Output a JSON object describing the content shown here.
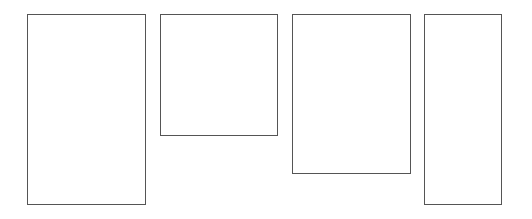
{
  "diagram": {
    "shape_count": 4,
    "shapes": [
      {
        "type": "rectangle",
        "label": ""
      },
      {
        "type": "rectangle",
        "label": ""
      },
      {
        "type": "rectangle",
        "label": ""
      },
      {
        "type": "rectangle",
        "label": ""
      }
    ],
    "colors": {
      "stroke": "#555555",
      "fill": "#ffffff",
      "background": "#ffffff"
    }
  }
}
